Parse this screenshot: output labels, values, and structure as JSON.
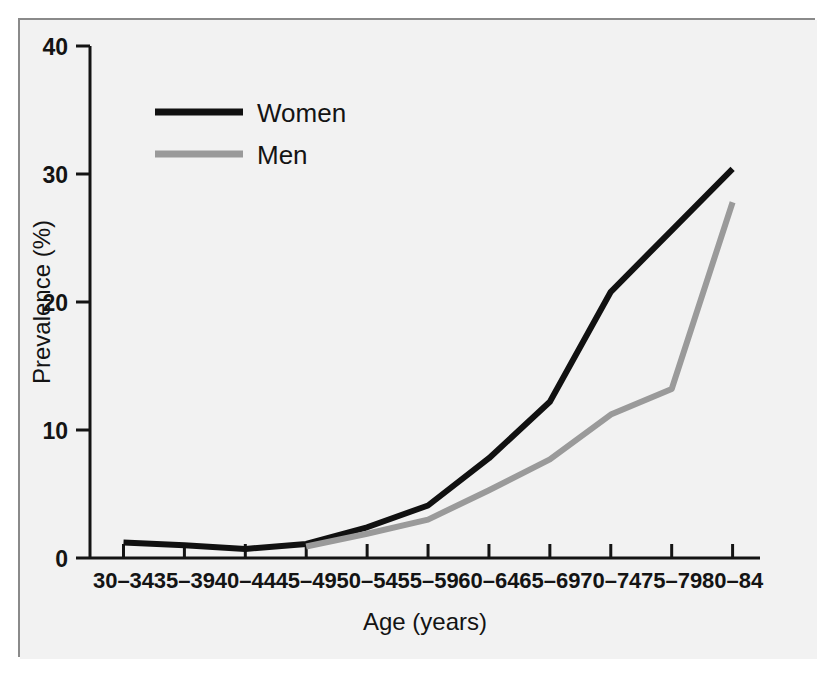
{
  "figure": {
    "panel_bg": "#f2f2f2",
    "frame_color": "#8a8a8a",
    "top_cut_text": "",
    "caption_cut_text": ""
  },
  "chart_data": {
    "type": "line",
    "title": "",
    "xlabel": "Age (years)",
    "ylabel": "Prevalence (%)",
    "categories": [
      "30–34",
      "35–39",
      "40–44",
      "45–49",
      "50–54",
      "55–59",
      "60–64",
      "65–69",
      "70–74",
      "75–79",
      "80–84"
    ],
    "ylim": [
      0,
      40
    ],
    "yticks": [
      0,
      10,
      20,
      30,
      40
    ],
    "ytick_labels": [
      "0",
      "10",
      "20",
      "30",
      "40"
    ],
    "grid": false,
    "legend_position": "top-left",
    "series": [
      {
        "name": "Women",
        "color": "#111111",
        "values": [
          1.2,
          1.0,
          0.7,
          1.1,
          2.4,
          4.1,
          7.8,
          12.2,
          20.8,
          25.6,
          30.4
        ]
      },
      {
        "name": "Men",
        "color": "#9a9a9a",
        "values": [
          null,
          null,
          null,
          0.9,
          1.9,
          3.0,
          5.3,
          7.7,
          11.2,
          13.2,
          27.8
        ]
      }
    ]
  },
  "legend": {
    "items": [
      {
        "label": "Women",
        "color": "#111111"
      },
      {
        "label": "Men",
        "color": "#9a9a9a"
      }
    ]
  }
}
